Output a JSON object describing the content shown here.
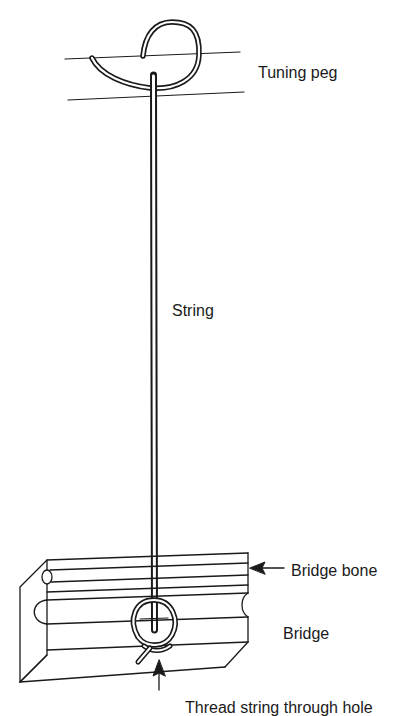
{
  "figure": {
    "type": "illustration",
    "labels": {
      "tuning_peg": "Tuning peg",
      "string": "String",
      "bridge_bone": "Bridge bone",
      "bridge": "Bridge",
      "thread_note": "Thread string through hole"
    },
    "colors": {
      "ink": "#1a1a1a",
      "background": "#ffffff"
    }
  }
}
